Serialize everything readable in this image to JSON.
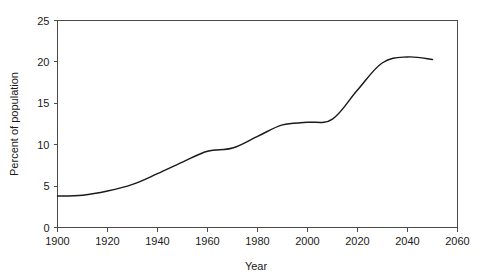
{
  "chart_data": {
    "type": "line",
    "title": "",
    "subtitle": "",
    "xlabel": "Year",
    "ylabel": "Percent of population",
    "xlim": [
      1900,
      2060
    ],
    "ylim": [
      0,
      25
    ],
    "xticks": [
      1900,
      1920,
      1940,
      1960,
      1980,
      2000,
      2020,
      2040,
      2060
    ],
    "yticks": [
      0,
      5,
      10,
      15,
      20,
      25
    ],
    "grid": false,
    "legend": false,
    "legend_position": "none",
    "series": [
      {
        "name": "Percent of population",
        "color": "#1a1a1a",
        "x": [
          1900,
          1910,
          1920,
          1930,
          1940,
          1950,
          1960,
          1970,
          1980,
          1990,
          2000,
          2010,
          2020,
          2030,
          2040,
          2050
        ],
        "values": [
          3.8,
          3.9,
          4.4,
          5.2,
          6.5,
          7.9,
          9.2,
          9.6,
          11.0,
          12.4,
          12.7,
          13.1,
          16.6,
          19.9,
          20.6,
          20.3
        ]
      }
    ]
  },
  "axes": {
    "x": {
      "label": "Year",
      "tick_labels": [
        "1900",
        "1920",
        "1940",
        "1960",
        "1980",
        "2000",
        "2020",
        "2040",
        "2060"
      ]
    },
    "y": {
      "label": "Percent of population",
      "tick_labels": [
        "0",
        "5",
        "10",
        "15",
        "20",
        "25"
      ]
    }
  },
  "style": {
    "axis_color": "#4a4a4a",
    "line_color": "#1a1a1a",
    "background": "#ffffff",
    "text_color": "#1a1a1a"
  }
}
